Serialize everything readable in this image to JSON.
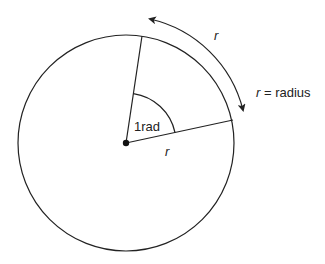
{
  "diagram": {
    "labels": {
      "angle": "1rad",
      "arc_length": "r",
      "radius_line": "r",
      "legend_var": "r",
      "legend_rest": " = radius"
    },
    "geometry": {
      "center": [
        126,
        143
      ],
      "circle_radius": 108,
      "radius_end_top": [
        142,
        33
      ],
      "radius_end_right": [
        232,
        120
      ],
      "angle_arc_radius": 50
    },
    "colors": {
      "stroke": "#222222",
      "background": "#ffffff"
    }
  }
}
